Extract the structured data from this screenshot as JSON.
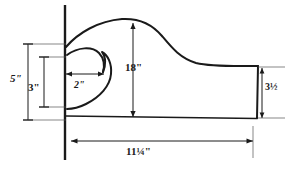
{
  "drawing": {
    "title": "Bracket profile pattern drawing",
    "line_color": "#1a1a1a",
    "background_color": "#ffffff",
    "dimensions": [
      {
        "id": "height-5in",
        "label": "5\"",
        "value": 5,
        "unit": "inch",
        "orientation": "vertical",
        "name": "dimension-5-inch"
      },
      {
        "id": "height-3in",
        "label": "3\"",
        "value": 3,
        "unit": "inch",
        "orientation": "vertical",
        "name": "dimension-3-inch"
      },
      {
        "id": "notch-2in",
        "label": "2\"",
        "value": 2,
        "unit": "inch",
        "orientation": "horizontal",
        "name": "dimension-2-inch"
      },
      {
        "id": "height-18in",
        "label": "18\"",
        "value": 18,
        "unit": "inch",
        "orientation": "vertical",
        "name": "dimension-18-inch"
      },
      {
        "id": "tail-3half",
        "label": "3½",
        "value": 3.5,
        "unit": "inch",
        "orientation": "vertical",
        "name": "dimension-3-and-a-half"
      },
      {
        "id": "length-11quarter",
        "label": "11¼\"",
        "value": 11.25,
        "unit": "inch",
        "orientation": "horizontal",
        "name": "dimension-11-and-a-quarter"
      }
    ]
  }
}
